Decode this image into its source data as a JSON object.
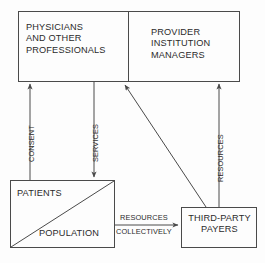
{
  "diagram": {
    "background_color": "#fdfdfd",
    "line_color": "#4a4a4a",
    "text_color": "#2b2b2b",
    "nodes": {
      "physicians": {
        "label": "PHYSICIANS\nAND OTHER\nPROFESSIONALS"
      },
      "provider_managers": {
        "label": "PROVIDER\nINSTITUTION\nMANAGERS"
      },
      "patients": {
        "label": "PATIENTS"
      },
      "population": {
        "label": "POPULATION"
      },
      "third_party_payers": {
        "label": "THIRD-PARTY\nPAYERS"
      }
    },
    "edges": {
      "consent": {
        "label": "CONSENT"
      },
      "services": {
        "label": "SERVICES"
      },
      "resources_vertical": {
        "label": "RESOURCES"
      },
      "resources_horizontal": {
        "label": "RESOURCES"
      },
      "collectively": {
        "label": "COLLECTIVELY"
      }
    }
  }
}
